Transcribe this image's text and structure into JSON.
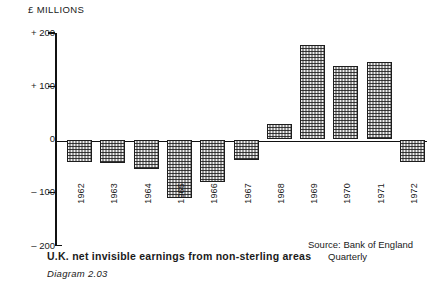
{
  "chart_data": {
    "type": "bar",
    "title": "U.K. net invisible earnings from non-sterling areas",
    "axis_title": "£ MILLIONS",
    "xlabel": "",
    "ylabel": "£ MILLIONS",
    "ylim": [
      -200,
      200
    ],
    "yticks": [
      200,
      100,
      0,
      -100,
      -200
    ],
    "ytick_labels": [
      "+ 200",
      "+ 100",
      "0",
      "– 100",
      "– 200"
    ],
    "grid": false,
    "legend": "none",
    "categories": [
      "1962",
      "1963",
      "1964",
      "1965",
      "1966",
      "1967",
      "1968",
      "1969",
      "1970",
      "1971",
      "1972"
    ],
    "values": [
      -42,
      -45,
      -56,
      -110,
      -80,
      -38,
      30,
      177,
      138,
      146,
      -42
    ],
    "source": "Source: Bank of England",
    "source_line2": "Quarterly",
    "diagram_number": "Diagram 2.03"
  },
  "caption": {
    "main": "U.K. net invisible earnings from non-sterling areas",
    "source_line1": "Source: Bank of England",
    "source_line2": "Quarterly",
    "diagram": "Diagram 2.03"
  },
  "axis": {
    "title": "£ MILLIONS"
  }
}
